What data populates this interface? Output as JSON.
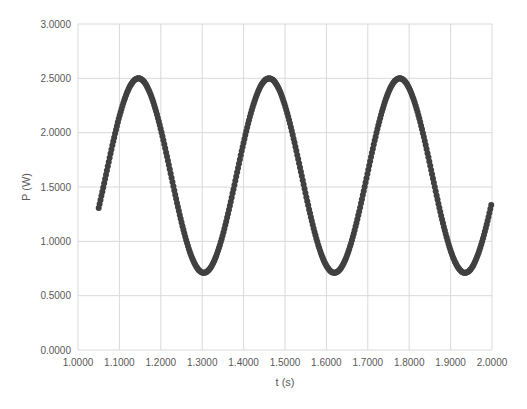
{
  "chart_data": {
    "type": "scatter",
    "title": "",
    "xlabel": "t (s)",
    "ylabel": "P (W)",
    "xlim": [
      1.0,
      2.0
    ],
    "ylim": [
      0.0,
      3.0
    ],
    "grid": true,
    "legend": null,
    "x_ticks": [
      "1.0000",
      "1.1000",
      "1.2000",
      "1.3000",
      "1.4000",
      "1.5000",
      "1.6000",
      "1.7000",
      "1.8000",
      "1.9000",
      "2.0000"
    ],
    "y_ticks": [
      "0.0000",
      "0.5000",
      "1.0000",
      "1.5000",
      "2.0000",
      "2.5000",
      "3.0000"
    ],
    "marker_color": "#404040",
    "model": {
      "description": "sinusoidal power vs time",
      "offset": 1.605,
      "amplitude": 0.895,
      "period": 0.3155,
      "first_peak_t": 1.146
    },
    "series": [
      {
        "name": "P",
        "x": [
          1.05,
          1.075,
          1.1,
          1.125,
          1.146,
          1.175,
          1.2,
          1.225,
          1.25,
          1.275,
          1.3,
          1.325,
          1.35,
          1.375,
          1.4,
          1.425,
          1.45,
          1.462,
          1.475,
          1.5,
          1.525,
          1.55,
          1.575,
          1.595,
          1.625,
          1.65,
          1.675,
          1.7,
          1.725,
          1.75,
          1.777,
          1.8,
          1.825,
          1.85,
          1.875,
          1.9,
          1.92,
          1.95,
          1.975,
          2.0
        ],
        "y": [
          1.54,
          1.93,
          2.26,
          2.45,
          2.5,
          2.43,
          2.19,
          1.86,
          1.47,
          1.1,
          0.8,
          0.72,
          0.87,
          1.18,
          1.57,
          1.95,
          2.36,
          2.5,
          2.47,
          2.27,
          1.91,
          1.48,
          1.03,
          0.71,
          0.78,
          1.07,
          1.45,
          1.86,
          2.2,
          2.42,
          2.48,
          2.39,
          2.14,
          1.8,
          1.4,
          0.98,
          0.73,
          0.8,
          1.14,
          1.55
        ]
      }
    ]
  }
}
